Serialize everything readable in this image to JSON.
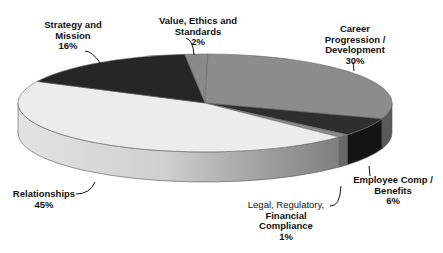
{
  "chart_data": {
    "type": "pie",
    "style": "3d-exploded-none",
    "title": "",
    "categories": [
      "Value, Ethics and Standards",
      "Career Progression / Development",
      "Employee Comp / Benefits",
      "Legal, Regulatory, Financial Compliance",
      "Relationships",
      "Strategy and Mission"
    ],
    "values": [
      2,
      30,
      6,
      1,
      45,
      16
    ],
    "unit": "%",
    "legend": "none",
    "slices": [
      {
        "name": "Value, Ethics and Standards",
        "value": 2,
        "color": "#8a8a8a",
        "side": "#6e6e6e"
      },
      {
        "name": "Career Progression / Development",
        "value": 30,
        "color": "#8c8c8c",
        "side": "#5a5a5a"
      },
      {
        "name": "Employee Comp / Benefits",
        "value": 6,
        "color": "#2e2e2e",
        "side": "#141414"
      },
      {
        "name": "Legal, Regulatory, Financial Compliance",
        "value": 1,
        "color": "#8a8a8a",
        "side": "#6a6a6a"
      },
      {
        "name": "Relationships",
        "value": 45,
        "color": "#ececec",
        "side": "#d4d4d4"
      },
      {
        "name": "Strategy and Mission",
        "value": 16,
        "color": "#262626",
        "side": "#1a1a1a"
      }
    ]
  },
  "labels": {
    "value_ethics": {
      "lines": [
        "Value, Ethics and",
        "Standards"
      ],
      "pct": "2%"
    },
    "career": {
      "lines": [
        "Career",
        "Progression /",
        "Development"
      ],
      "pct": "30%"
    },
    "employee_comp": {
      "lines": [
        "Employee Comp /",
        "Benefits"
      ],
      "pct": "6%"
    },
    "legal": {
      "line1": "Legal, Regulatory,",
      "lines": [
        "Financial",
        "Compliance"
      ],
      "pct": "1%"
    },
    "relationships": {
      "lines": [
        "Relationships"
      ],
      "pct": "45%"
    },
    "strategy": {
      "lines": [
        "Strategy and",
        "Mission"
      ],
      "pct": "16%"
    }
  }
}
